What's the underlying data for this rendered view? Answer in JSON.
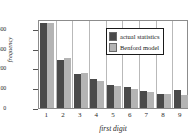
{
  "chart_data": {
    "type": "bar",
    "title": "",
    "subtitle": "",
    "xlabel": "first digit",
    "ylabel": "frequency",
    "categories": [
      "1",
      "2",
      "3",
      "4",
      "5",
      "6",
      "7",
      "8",
      "9"
    ],
    "series": [
      {
        "name": "actual statistics",
        "color": "#4a4a4a",
        "values": [
          432,
          243,
          172,
          148,
          118,
          108,
          88,
          73,
          89
        ]
      },
      {
        "name": "Benford model",
        "color": "#b4b4b4",
        "values": [
          430,
          252,
          179,
          139,
          113,
          96,
          83,
          73,
          66
        ]
      }
    ],
    "ylim": [
      0,
      450
    ],
    "yticks": [
      0,
      100,
      200,
      300,
      400
    ],
    "ytick_labels": [
      "0",
      "100",
      "200",
      "300",
      "400"
    ],
    "xtick_labels": [
      "1",
      "2",
      "3",
      "4",
      "5",
      "6",
      "7",
      "8",
      "9"
    ],
    "grid": "vertical",
    "legend_position": "top-right"
  }
}
